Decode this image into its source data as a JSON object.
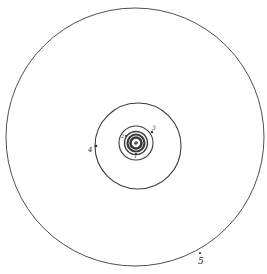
{
  "diagram": {
    "type": "concentric-orbits",
    "stroke_color": "#3a3a3a",
    "background": "#ffffff",
    "orbits": [
      {
        "id": "orbit-5",
        "label": "5",
        "cx": 135,
        "cy": 137,
        "r": 129
      },
      {
        "id": "orbit-4",
        "label": "4",
        "cx": 138,
        "cy": 146,
        "r": 43
      },
      {
        "id": "orbit-3",
        "label": "3",
        "cx": 136,
        "cy": 143,
        "r": 17
      },
      {
        "id": "orbit-2",
        "label": "2",
        "cx": 136,
        "cy": 143,
        "r": 11
      },
      {
        "id": "orbit-1",
        "label": "1",
        "cx": 136,
        "cy": 143,
        "r": 8
      }
    ],
    "labels": {
      "l5": "5",
      "l4": "4",
      "l3": "3",
      "l2": "2",
      "l1": "1"
    }
  }
}
